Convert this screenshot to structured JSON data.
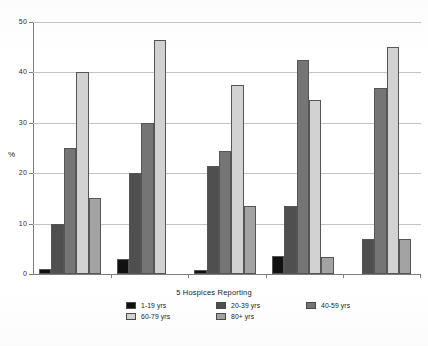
{
  "chart_data": {
    "type": "bar",
    "title": "",
    "subtitle": "",
    "xlabel": "5 Hospices Reporting",
    "ylabel": "%",
    "categories": [
      "Hospice 1",
      "Hospice 2",
      "Hospice 3",
      "Hospice 4",
      "Hospice 5"
    ],
    "series": [
      {
        "name": "1-19 yrs",
        "color": "#111111",
        "values": [
          1.0,
          3.0,
          0.7,
          3.5,
          0.0
        ]
      },
      {
        "name": "20-39 yrs",
        "color": "#4f4f4f",
        "values": [
          10.0,
          20.0,
          21.5,
          13.5,
          7.0
        ]
      },
      {
        "name": "40-59 yrs",
        "color": "#757575",
        "values": [
          25.0,
          30.0,
          24.5,
          42.5,
          37.0
        ]
      },
      {
        "name": "60-79 yrs",
        "color": "#d2d2d2",
        "values": [
          40.0,
          46.5,
          37.5,
          34.5,
          45.0
        ]
      },
      {
        "name": "80+ yrs",
        "color": "#a3a3a3",
        "values": [
          15.0,
          0.0,
          13.5,
          3.3,
          7.0
        ]
      }
    ],
    "ylim": [
      0,
      50
    ],
    "yticks": [
      0,
      10,
      20,
      30,
      40,
      50
    ],
    "ytick_labels": [
      "0",
      "10",
      "20",
      "30",
      "40",
      "50"
    ],
    "grid": true,
    "grid_axis": "y",
    "legend_position": "bottom",
    "bar_style": "grouped",
    "background": "#ffffff"
  },
  "axes": {
    "y_title": "%",
    "x_title": "5 Hospices Reporting",
    "tick_labels": [
      "0",
      "10",
      "20",
      "30",
      "40",
      "50"
    ]
  },
  "legend": {
    "row1": [
      {
        "label": "1-19 yrs",
        "swatch": "#111111"
      },
      {
        "label": "20-39 yrs",
        "swatch": "#4f4f4f"
      },
      {
        "label": "40-59 yrs",
        "swatch": "#757575"
      }
    ],
    "row2": [
      {
        "label": "60-79 yrs",
        "swatch": "#d2d2d2"
      },
      {
        "label": "80+ yrs",
        "swatch": "#a3a3a3"
      }
    ]
  }
}
